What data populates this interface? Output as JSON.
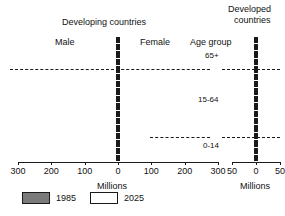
{
  "titles": {
    "developing": "Developing countries",
    "developed_line1": "Developed",
    "developed_line2": "countries"
  },
  "labels": {
    "male": "Male",
    "female": "Female",
    "age_group": "Age group",
    "millions_left": "Millions",
    "millions_right": "Millions"
  },
  "age_groups": [
    {
      "id": "65plus",
      "label": "65+"
    },
    {
      "id": "15to64",
      "label": "15-64"
    },
    {
      "id": "0to14",
      "label": "0-14"
    }
  ],
  "legend": {
    "items": [
      {
        "label": "1985",
        "swatch": "filled",
        "color": "#7a7a7a"
      },
      {
        "label": "2025",
        "swatch": "hollow",
        "color": "#ffffff"
      }
    ]
  },
  "colors": {
    "series_1985": "#7a7a7a",
    "series_2025": "#ffffff",
    "outline": "#1a1a1a",
    "background": "#ffffff"
  },
  "chart_data": {
    "type": "bar",
    "subtype": "population-pyramid",
    "xlabel": "Millions",
    "ylabel": "Age group",
    "grid": false,
    "legend_position": "bottom-left",
    "panels": [
      {
        "name": "Developing countries",
        "xlim": [
          -300,
          300
        ],
        "xticks": [
          300,
          200,
          100,
          0,
          100,
          200,
          300
        ],
        "xtick_values": [
          -300,
          -200,
          -100,
          0,
          100,
          200,
          300
        ],
        "sides": [
          "Male",
          "Female"
        ],
        "age_bands": [
          "0-4",
          "5-9",
          "10-14",
          "15-19",
          "20-24",
          "25-29",
          "30-34",
          "35-39",
          "40-44",
          "45-49",
          "50-54",
          "55-59",
          "60-64",
          "65-69",
          "70-74",
          "75-79",
          "80+"
        ],
        "series": [
          {
            "name": "1985",
            "male": [
              235,
              222,
              205,
              190,
              172,
              152,
              132,
              113,
              96,
              80,
              66,
              54,
              43,
              32,
              22,
              13,
              6
            ],
            "female": [
              226,
              214,
              198,
              183,
              166,
              147,
              128,
              110,
              94,
              79,
              65,
              54,
              43,
              33,
              23,
              14,
              7
            ]
          },
          {
            "name": "2025",
            "male": [
              252,
              250,
              248,
              246,
              243,
              238,
              230,
              219,
              205,
              186,
              163,
              137,
              110,
              83,
              58,
              36,
              18
            ],
            "female": [
              243,
              241,
              239,
              237,
              235,
              231,
              224,
              214,
              201,
              184,
              163,
              139,
              113,
              87,
              62,
              40,
              21
            ]
          }
        ]
      },
      {
        "name": "Developed countries",
        "xlim": [
          -50,
          50
        ],
        "xticks": [
          50,
          0,
          50
        ],
        "xtick_values": [
          -50,
          0,
          50
        ],
        "sides": [
          "Male",
          "Female"
        ],
        "age_bands": [
          "0-4",
          "5-9",
          "10-14",
          "15-19",
          "20-24",
          "25-29",
          "30-34",
          "35-39",
          "40-44",
          "45-49",
          "50-54",
          "55-59",
          "60-64",
          "65-69",
          "70-74",
          "75-79",
          "80+"
        ],
        "series": [
          {
            "name": "1985",
            "male": [
              26,
              26,
              27,
              29,
              31,
              30,
              28,
              26,
              24,
              23,
              22,
              20,
              17,
              14,
              11,
              7,
              4
            ],
            "female": [
              25,
              25,
              26,
              28,
              30,
              29,
              27,
              26,
              24,
              23,
              23,
              21,
              19,
              16,
              14,
              10,
              6
            ]
          },
          {
            "name": "2025",
            "male": [
              24,
              25,
              26,
              27,
              28,
              29,
              30,
              30,
              31,
              31,
              31,
              30,
              29,
              27,
              23,
              17,
              10
            ],
            "female": [
              23,
              24,
              25,
              26,
              27,
              28,
              29,
              29,
              30,
              30,
              31,
              30,
              30,
              28,
              25,
              20,
              14
            ]
          }
        ]
      }
    ],
    "age_group_dividers": [
      {
        "label": "65+",
        "boundary_band_index": 13
      },
      {
        "label": "15-64",
        "boundary_band_index": 3
      },
      {
        "label": "0-14",
        "boundary_band_index": 0
      }
    ]
  }
}
